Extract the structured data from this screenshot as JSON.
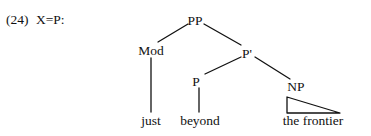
{
  "figure": {
    "example_number": "(24)",
    "category_label": "X=P:"
  },
  "tree": {
    "nodes": {
      "pp": "PP",
      "mod": "Mod",
      "pbar": "P'",
      "p": "P",
      "np": "NP"
    },
    "leaves": {
      "mod_word": "just",
      "p_word": "beyond",
      "np_phrase": "the frontier"
    }
  },
  "style": {
    "ink_color": "#111111",
    "background_color": "#ffffff"
  }
}
